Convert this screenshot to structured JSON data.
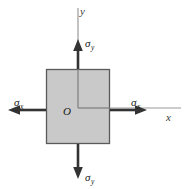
{
  "figure": {
    "kind": "stress-element-diagram",
    "background_color": "#ffffff"
  },
  "element": {
    "name": "stress-square",
    "fill_color": "#c9c9c9",
    "stroke_color": "#5a5a5a",
    "x": 46,
    "y": 69,
    "width": 64,
    "height": 75
  },
  "axes": {
    "origin_label": "O",
    "origin_x": 78,
    "origin_y": 108,
    "line_color": "#9a9a9a",
    "x_axis": {
      "label": "x",
      "from_x": 78,
      "to_x": 181,
      "y": 108
    },
    "y_axis": {
      "label": "y",
      "x": 78,
      "from_y": 108,
      "to_y": 8
    }
  },
  "stress_arrows": {
    "color": "#333333",
    "items": [
      {
        "name": "sigma-y-top",
        "symbol": "σ",
        "subscript": "y",
        "direction": "up",
        "tail_x": 78,
        "tail_y": 69,
        "tip_x": 78,
        "tip_y": 40
      },
      {
        "name": "sigma-y-bottom",
        "symbol": "σ",
        "subscript": "y",
        "direction": "down",
        "tail_x": 78,
        "tail_y": 144,
        "tip_x": 78,
        "tip_y": 178
      },
      {
        "name": "sigma-x-left",
        "symbol": "σ",
        "subscript": "x",
        "direction": "left",
        "tail_x": 46,
        "tail_y": 110,
        "tip_x": 8,
        "tip_y": 110
      },
      {
        "name": "sigma-x-right",
        "symbol": "σ",
        "subscript": "x",
        "direction": "right",
        "tail_x": 110,
        "tail_y": 110,
        "tip_x": 147,
        "tip_y": 110
      }
    ]
  },
  "labels": {
    "y_axis": "y",
    "x_axis": "x",
    "origin": "O",
    "sigma": "σ",
    "sub_x": "x",
    "sub_y": "y"
  }
}
